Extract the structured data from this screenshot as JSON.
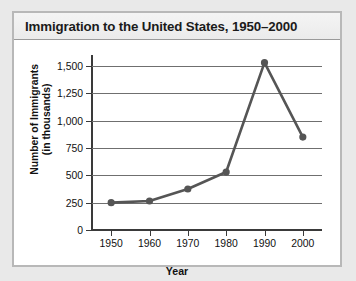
{
  "chart_data": {
    "type": "line",
    "title": "Immigration to the United States, 1950–2000",
    "xlabel": "Year",
    "ylabel": "Number of Immigrants\n(in thousands)",
    "ylabel_lines": [
      "Number of Immigrants",
      "(in thousands)"
    ],
    "categories": [
      "1950",
      "1960",
      "1970",
      "1980",
      "1990",
      "2000"
    ],
    "x": [
      1950,
      1960,
      1970,
      1980,
      1990,
      2000
    ],
    "values": [
      250,
      265,
      375,
      530,
      1530,
      850
    ],
    "series": [
      {
        "name": "Immigrants (in thousands)",
        "values": [
          250,
          265,
          375,
          530,
          1530,
          850
        ]
      }
    ],
    "ylim": [
      0,
      1600
    ],
    "yticks": [
      0,
      250,
      500,
      750,
      1000,
      1250,
      1500
    ],
    "ytick_labels": [
      "0",
      "250",
      "500",
      "750",
      "1,000",
      "1,250",
      "1,500"
    ],
    "xlim": [
      1945,
      2005
    ],
    "xticks": [
      1950,
      1960,
      1970,
      1980,
      1990,
      2000
    ],
    "xtick_labels": [
      "1950",
      "1960",
      "1970",
      "1980",
      "1990",
      "2000"
    ],
    "grid": "horizontal",
    "legend": "none",
    "line_color": "#555555",
    "marker_color": "#555555",
    "marker_shape": "circle",
    "axis_color": "#3a3a3a",
    "grid_color": "#6f6f6f",
    "background_color": "#ffffff",
    "title_bar_color": "#efefef",
    "page_background": "#e9e9e9"
  }
}
